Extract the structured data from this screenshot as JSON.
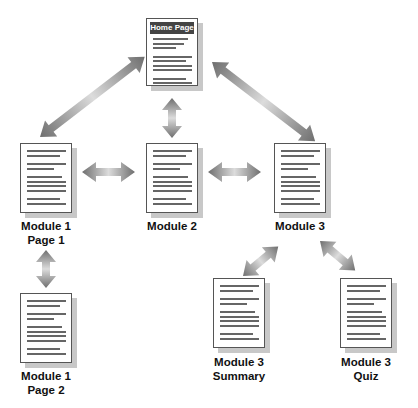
{
  "diagram": {
    "nodes": [
      {
        "id": "home",
        "header": "Home Page",
        "label": "",
        "x": 146,
        "y": 20
      },
      {
        "id": "m1p1",
        "label_lines": [
          "Module 1",
          "Page 1"
        ],
        "x": 20,
        "y": 143
      },
      {
        "id": "m2",
        "label_lines": [
          "Module 2"
        ],
        "x": 146,
        "y": 143
      },
      {
        "id": "m3",
        "label_lines": [
          "Module 3"
        ],
        "x": 274,
        "y": 143
      },
      {
        "id": "m1p2",
        "label_lines": [
          "Module 1",
          "Page 2"
        ],
        "x": 20,
        "y": 293
      },
      {
        "id": "m3s",
        "label_lines": [
          "Module 3",
          "Summary"
        ],
        "x": 213,
        "y": 278
      },
      {
        "id": "m3q",
        "label_lines": [
          "Module 3",
          "Quiz"
        ],
        "x": 340,
        "y": 278
      }
    ],
    "edges": [
      [
        "home",
        "m1p1"
      ],
      [
        "home",
        "m2"
      ],
      [
        "home",
        "m3"
      ],
      [
        "m1p1",
        "m2"
      ],
      [
        "m2",
        "m3"
      ],
      [
        "m1p1",
        "m1p2"
      ],
      [
        "m3",
        "m3s"
      ],
      [
        "m3",
        "m3q"
      ]
    ],
    "edge_style": "bidirectional gray gradient arrows"
  },
  "labels": {
    "home": "Home Page",
    "m1p1_1": "Module 1",
    "m1p1_2": "Page 1",
    "m2": "Module 2",
    "m3": "Module 3",
    "m1p2_1": "Module 1",
    "m1p2_2": "Page 2",
    "m3s_1": "Module 3",
    "m3s_2": "Summary",
    "m3q_1": "Module 3",
    "m3q_2": "Quiz"
  }
}
